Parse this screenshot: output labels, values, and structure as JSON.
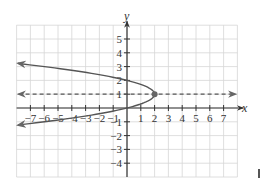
{
  "chart_data": {
    "type": "line",
    "title": "",
    "xlabel": "x",
    "ylabel": "y",
    "xlim": [
      -8,
      8
    ],
    "ylim": [
      -5,
      6
    ],
    "grid": true,
    "x_tick_labels": [
      "−7",
      "−6",
      "−5",
      "−4",
      "−3",
      "−2",
      "−1",
      "1",
      "2",
      "3",
      "4",
      "5",
      "6",
      "7"
    ],
    "x_ticks": [
      -7,
      -6,
      -5,
      -4,
      -3,
      -2,
      -1,
      1,
      2,
      3,
      4,
      5,
      6,
      7
    ],
    "y_tick_labels": [
      "5",
      "4",
      "3",
      "2",
      "1",
      "−1",
      "−2",
      "−3",
      "−4"
    ],
    "y_ticks": [
      5,
      4,
      3,
      2,
      1,
      -1,
      -2,
      -3,
      -4
    ],
    "series": [
      {
        "name": "parabola",
        "equation": "x = 2 - 2(y - 1)^2",
        "style": "solid",
        "color": "#555555",
        "vertex": [
          2,
          1
        ],
        "endpoints": [
          [
            -8,
            3.24
          ],
          [
            -8,
            -1.24
          ]
        ],
        "arrows": "both ends toward left"
      },
      {
        "name": "axis of symmetry",
        "equation": "y = 1",
        "style": "dashed",
        "color": "#555555",
        "arrows": "both ends"
      }
    ],
    "points": [
      {
        "label": "vertex",
        "x": 2,
        "y": 1
      }
    ]
  },
  "axes": {
    "x_label": "x",
    "y_label": "y"
  }
}
